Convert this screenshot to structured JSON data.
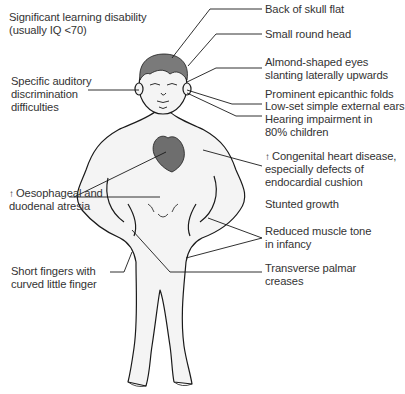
{
  "diagram": {
    "type": "annotated anatomical illustration",
    "colors": {
      "line": "#1a1a1a",
      "hair": "#7a7a7a",
      "heart": "#6e6e6e",
      "skin": "#f4f4f4",
      "text": "#333333"
    }
  },
  "labels_left": [
    {
      "id": "learning",
      "text": "Significant learning disability\n(usually IQ <70)"
    },
    {
      "id": "auditory",
      "text": "Specific auditory\ndiscrimination\ndifficulties"
    },
    {
      "id": "atresia",
      "prefix": "↑",
      "text": "Oesophageal and\nduodenal atresia"
    },
    {
      "id": "fingers",
      "text": "Short fingers with\ncurved little finger"
    }
  ],
  "labels_right": [
    {
      "id": "skull",
      "text": "Back of skull flat"
    },
    {
      "id": "head",
      "text": "Small round head"
    },
    {
      "id": "eyes",
      "text": "Almond-shaped eyes\nslanting laterally upwards"
    },
    {
      "id": "epicanthic",
      "text": "Prominent epicanthic folds"
    },
    {
      "id": "ears",
      "text": "Low-set simple external ears"
    },
    {
      "id": "hearing",
      "text": "Hearing impairment in\n80% children"
    },
    {
      "id": "heart",
      "prefix": "↑",
      "text": "Congenital heart disease,\nespecially defects of\nendocardial cushion"
    },
    {
      "id": "growth",
      "text": "Stunted growth"
    },
    {
      "id": "muscle",
      "text": "Reduced muscle tone\nin infancy"
    },
    {
      "id": "palmar",
      "text": "Transverse palmar\ncreases"
    }
  ]
}
